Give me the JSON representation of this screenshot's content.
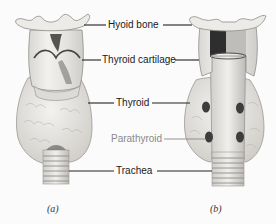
{
  "figure": {
    "labels": [
      {
        "id": "hyoid-bone",
        "text": "Hyoid bone",
        "style": "dark"
      },
      {
        "id": "thyroid-cartilage",
        "text": "Thyroid cartilage",
        "style": "dark"
      },
      {
        "id": "thyroid",
        "text": "Thyroid",
        "style": "dark"
      },
      {
        "id": "parathyroid",
        "text": "Parathyroid",
        "style": "gray"
      },
      {
        "id": "trachea",
        "text": "Trachea",
        "style": "dark"
      }
    ],
    "panels": [
      {
        "id": "a",
        "caption": "(a)",
        "view": "anterior"
      },
      {
        "id": "b",
        "caption": "(b)",
        "view": "posterior"
      }
    ],
    "colors": {
      "background": "#fbfbfb",
      "tissue": "#e8e6e2",
      "shadow": "#3a3a3a",
      "parathyroid": "#3d3d3d",
      "label_dark": "#1a1a1a",
      "label_gray": "#8a8a8a"
    }
  }
}
